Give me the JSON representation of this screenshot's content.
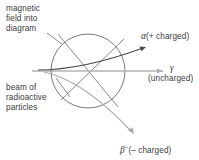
{
  "diagram": {
    "colors": {
      "stroke_dark": "#4a4a4a",
      "stroke_mid": "#6b6b6b",
      "stroke_light": "#a8a8a8",
      "text": "#3a3a3a",
      "background": "#ffffff"
    },
    "field_region": {
      "shape": "circle",
      "center_x": 88,
      "center_y": 71,
      "radius": 37
    }
  },
  "labels": {
    "field": "magnetic\nfield into\ndiagram",
    "beam": "beam of\nradioactive\nparticles",
    "alpha_symbol": "α",
    "alpha_charge": "(+ charged)",
    "gamma_symbol": "γ",
    "gamma_charge": "(uncharged)",
    "beta_symbol": "β",
    "beta_superscript": "−",
    "beta_charge": "(– charged)"
  },
  "paths": {
    "beam_in": "incoming horizontal beam from left edge",
    "alpha": "curves upward to the right, arrow tip at upper right",
    "gamma": "continues straight horizontally, arrow tip at right",
    "beta": "curves downward to the right, arrow tip at lower right"
  }
}
